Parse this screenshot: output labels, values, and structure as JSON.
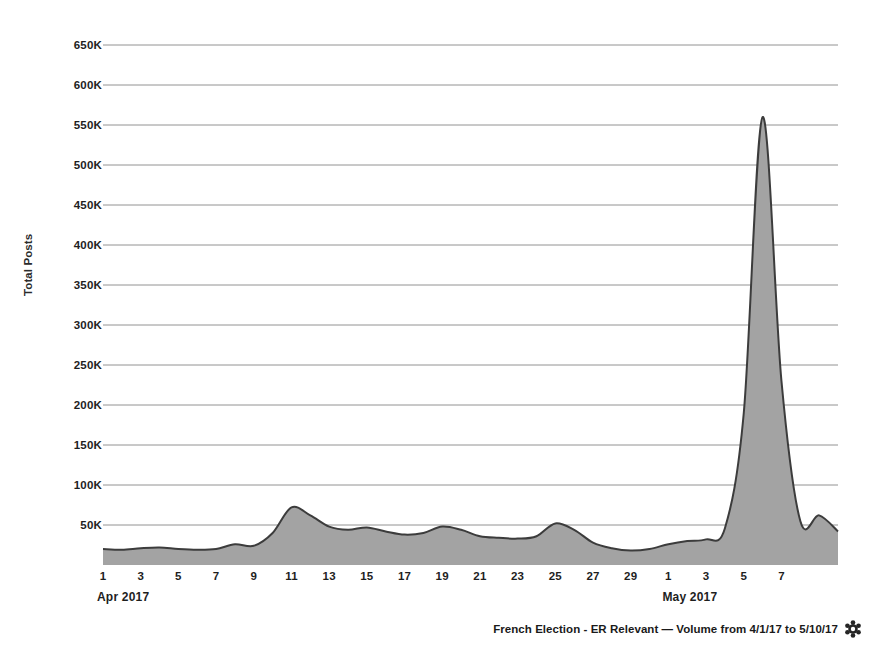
{
  "chart_data": {
    "type": "area",
    "title": "",
    "xlabel": "",
    "ylabel": "Total Posts",
    "ylim": [
      0,
      675000
    ],
    "grid": true,
    "legend": "none",
    "series_color": "#a3a3a3",
    "line_color": "#3c3c3c",
    "y_ticks": [
      "50K",
      "100K",
      "150K",
      "200K",
      "250K",
      "300K",
      "350K",
      "400K",
      "450K",
      "500K",
      "550K",
      "600K",
      "650K"
    ],
    "y_tick_values": [
      50000,
      100000,
      150000,
      200000,
      250000,
      300000,
      350000,
      400000,
      450000,
      500000,
      550000,
      600000,
      650000
    ],
    "x_tick_labels": [
      "1",
      "3",
      "5",
      "7",
      "9",
      "11",
      "13",
      "15",
      "17",
      "19",
      "21",
      "23",
      "25",
      "27",
      "29",
      "1",
      "3",
      "5",
      "7"
    ],
    "x_tick_days": [
      1,
      3,
      5,
      7,
      9,
      11,
      13,
      15,
      17,
      19,
      21,
      23,
      25,
      27,
      29,
      31,
      33,
      35,
      37
    ],
    "month_labels": [
      {
        "text": "Apr 2017",
        "day": 1
      },
      {
        "text": "May 2017",
        "day": 31
      }
    ],
    "x_range_days": [
      1,
      40
    ],
    "x": [
      1,
      2,
      3,
      4,
      5,
      6,
      7,
      8,
      9,
      10,
      11,
      12,
      13,
      14,
      15,
      16,
      17,
      18,
      19,
      20,
      21,
      22,
      23,
      24,
      25,
      26,
      27,
      28,
      29,
      30,
      31,
      32,
      33,
      34,
      35,
      36,
      37,
      38,
      39,
      40
    ],
    "x_date_labels": [
      "4/1",
      "4/2",
      "4/3",
      "4/4",
      "4/5",
      "4/6",
      "4/7",
      "4/8",
      "4/9",
      "4/10",
      "4/11",
      "4/12",
      "4/13",
      "4/14",
      "4/15",
      "4/16",
      "4/17",
      "4/18",
      "4/19",
      "4/20",
      "4/21",
      "4/22",
      "4/23",
      "4/24",
      "4/25",
      "4/26",
      "4/27",
      "4/28",
      "4/29",
      "4/30",
      "5/1",
      "5/2",
      "5/3",
      "5/4",
      "5/5",
      "5/6",
      "5/7",
      "5/8",
      "5/9",
      "5/10"
    ],
    "values": [
      20000,
      19000,
      21000,
      22000,
      20000,
      19000,
      20000,
      26000,
      24000,
      40000,
      72000,
      62000,
      48000,
      44000,
      47000,
      42000,
      38000,
      40000,
      48000,
      44000,
      36000,
      34000,
      33000,
      36000,
      52000,
      44000,
      28000,
      21000,
      18000,
      20000,
      26000,
      30000,
      32000,
      46000,
      190000,
      560000,
      230000,
      55000,
      62000,
      42000
    ]
  },
  "footer": {
    "text": "French Election - ER Relevant — Volume from 4/1/17 to 5/10/17",
    "icon": "gear-icon"
  }
}
